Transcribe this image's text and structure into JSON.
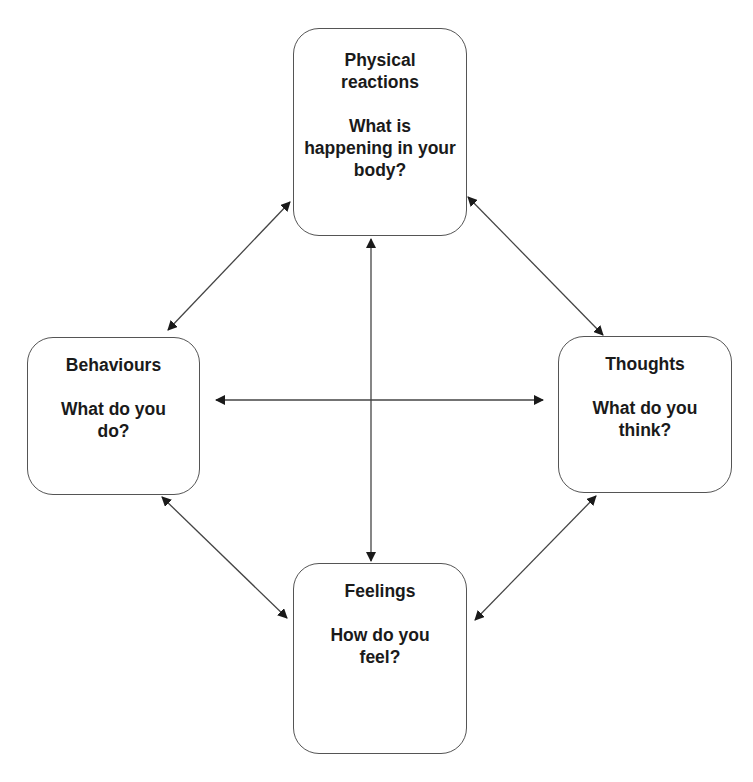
{
  "diagram": {
    "title": "",
    "colors": {
      "box_border": "#555555",
      "arrow": "#444444",
      "arrowhead": "#1a1a1a",
      "text": "#1a1a1a",
      "background": "#ffffff"
    },
    "nodes": [
      {
        "id": "physical",
        "title": "Physical reactions",
        "question": "What is happening in your body?"
      },
      {
        "id": "behaviours",
        "title": "Behaviours",
        "question": "What do you do?"
      },
      {
        "id": "thoughts",
        "title": "Thoughts",
        "question": "What do you think?"
      },
      {
        "id": "feelings",
        "title": "Feelings",
        "question": "How do you feel?"
      }
    ],
    "edges": [
      {
        "from": "physical",
        "to": "behaviours",
        "bidirectional": true
      },
      {
        "from": "physical",
        "to": "thoughts",
        "bidirectional": true
      },
      {
        "from": "behaviours",
        "to": "feelings",
        "bidirectional": true
      },
      {
        "from": "thoughts",
        "to": "feelings",
        "bidirectional": true
      },
      {
        "from": "behaviours",
        "to": "thoughts",
        "bidirectional": true
      },
      {
        "from": "physical",
        "to": "feelings",
        "bidirectional": true
      }
    ]
  }
}
